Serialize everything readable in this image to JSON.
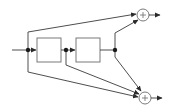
{
  "diagram": {
    "type": "block-diagram",
    "colors": {
      "wire": "#3a3a3a",
      "block_border": "#6b6b6b",
      "node": "#1a1a1a",
      "background": "#ffffff"
    },
    "blocks": [
      {
        "id": "block-1",
        "label": ""
      },
      {
        "id": "block-2",
        "label": ""
      }
    ],
    "adders": [
      {
        "id": "adder-top",
        "symbol": "+"
      },
      {
        "id": "adder-bottom",
        "symbol": "+"
      }
    ],
    "nodes": [
      "junction-input",
      "junction-mid",
      "junction-output"
    ],
    "connections": [
      {
        "from": "input",
        "to": "junction-input"
      },
      {
        "from": "junction-input",
        "to": "block-1"
      },
      {
        "from": "block-1",
        "to": "junction-mid"
      },
      {
        "from": "junction-mid",
        "to": "block-2"
      },
      {
        "from": "block-2",
        "to": "junction-output"
      },
      {
        "from": "junction-input",
        "to": "adder-top"
      },
      {
        "from": "junction-output",
        "to": "adder-top"
      },
      {
        "from": "junction-input",
        "to": "adder-bottom"
      },
      {
        "from": "junction-mid",
        "to": "adder-bottom"
      },
      {
        "from": "junction-output",
        "to": "adder-bottom"
      },
      {
        "from": "adder-top",
        "to": "output-top"
      },
      {
        "from": "adder-bottom",
        "to": "output-bottom"
      }
    ]
  }
}
